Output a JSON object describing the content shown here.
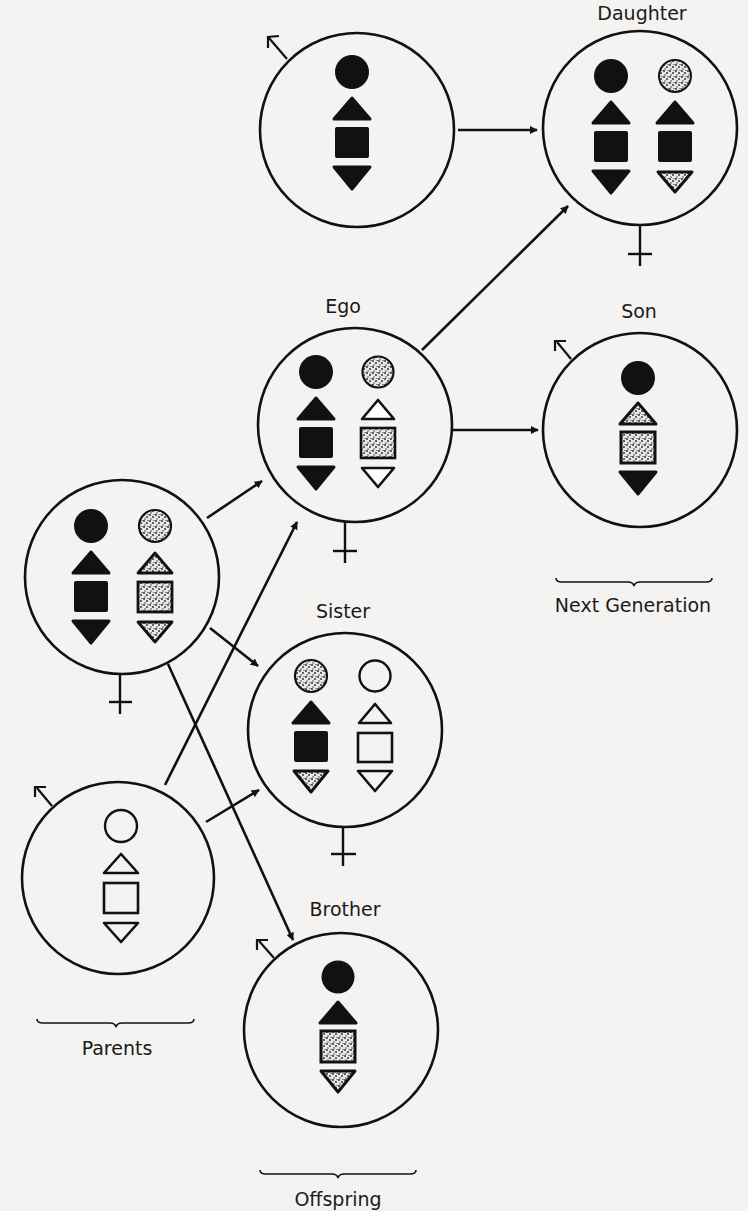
{
  "colors": {
    "background": "#f4f3f1",
    "ink": "#111111"
  },
  "labels": {
    "daughter": "Daughter",
    "ego": "Ego",
    "son": "Son",
    "next_generation": "Next Generation",
    "sister": "Sister",
    "brother": "Brother",
    "parents": "Parents",
    "offspring": "Offspring"
  },
  "legend": {
    "fill_types": [
      "solid",
      "stippled",
      "open"
    ],
    "chromosome_shapes": [
      "circle",
      "triangle-up",
      "square",
      "triangle-down"
    ]
  },
  "individuals": [
    {
      "id": "paternal-grandfather",
      "label": "",
      "sex": "male",
      "chromosome_sets": [
        [
          "solid",
          "solid",
          "solid",
          "solid"
        ]
      ]
    },
    {
      "id": "daughter",
      "label": "Daughter",
      "sex": "female",
      "chromosome_sets": [
        [
          "solid",
          "solid",
          "solid",
          "solid"
        ],
        [
          "stippled",
          "solid",
          "solid",
          "stippled"
        ]
      ]
    },
    {
      "id": "ego",
      "label": "Ego",
      "sex": "female",
      "chromosome_sets": [
        [
          "solid",
          "solid",
          "solid",
          "solid"
        ],
        [
          "stippled",
          "open",
          "stippled",
          "open"
        ]
      ]
    },
    {
      "id": "son",
      "label": "Son",
      "sex": "male",
      "chromosome_sets": [
        [
          "solid",
          "stippled",
          "stippled",
          "solid"
        ]
      ]
    },
    {
      "id": "mother",
      "label": "",
      "sex": "female",
      "chromosome_sets": [
        [
          "solid",
          "solid",
          "solid",
          "solid"
        ],
        [
          "stippled",
          "stippled",
          "stippled",
          "stippled"
        ]
      ]
    },
    {
      "id": "sister",
      "label": "Sister",
      "sex": "female",
      "chromosome_sets": [
        [
          "stippled",
          "solid",
          "solid",
          "stippled"
        ],
        [
          "open",
          "open",
          "open",
          "open"
        ]
      ]
    },
    {
      "id": "father",
      "label": "",
      "sex": "male",
      "chromosome_sets": [
        [
          "open",
          "open",
          "open",
          "open"
        ]
      ]
    },
    {
      "id": "brother",
      "label": "Brother",
      "sex": "male",
      "chromosome_sets": [
        [
          "solid",
          "solid",
          "stippled",
          "stippled"
        ]
      ]
    }
  ],
  "relations": [
    {
      "from": "paternal-grandfather",
      "to": "daughter"
    },
    {
      "from": "ego",
      "to": "daughter"
    },
    {
      "from": "ego",
      "to": "son"
    },
    {
      "from": "mother",
      "to": "ego"
    },
    {
      "from": "mother",
      "to": "sister"
    },
    {
      "from": "mother",
      "to": "brother"
    },
    {
      "from": "father",
      "to": "ego"
    },
    {
      "from": "father",
      "to": "sister"
    }
  ]
}
